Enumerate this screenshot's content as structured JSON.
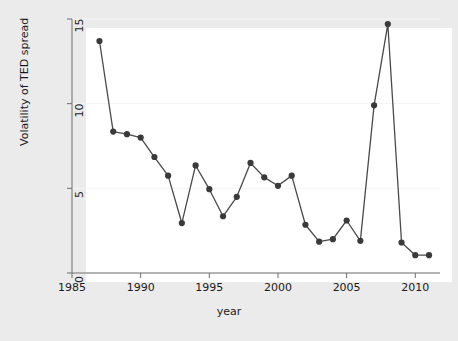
{
  "chart_data": {
    "type": "line",
    "title": "",
    "xlabel": "year",
    "ylabel": "Volatility of TED spread",
    "xlim": [
      1985,
      2011.8
    ],
    "ylim": [
      0,
      15
    ],
    "xticks": [
      1985,
      1990,
      1995,
      2000,
      2005,
      2010
    ],
    "yticks": [
      0,
      5,
      10,
      15
    ],
    "grid": true,
    "legend": null,
    "marker": "filled-circle",
    "line_color": "#4a4a4a",
    "marker_color": "#3a3a3a",
    "x": [
      1987,
      1988,
      1989,
      1990,
      1991,
      1992,
      1993,
      1994,
      1995,
      1996,
      1997,
      1998,
      1999,
      2000,
      2001,
      2002,
      2003,
      2004,
      2005,
      2006,
      2007,
      2008,
      2009,
      2010,
      2011
    ],
    "values": [
      13.7,
      8.35,
      8.2,
      8.0,
      6.85,
      5.75,
      2.95,
      6.35,
      4.95,
      3.35,
      4.5,
      6.5,
      5.65,
      5.15,
      5.75,
      2.85,
      1.85,
      2.0,
      3.1,
      1.9,
      9.9,
      14.7,
      1.8,
      1.05,
      1.05
    ],
    "series_name": "Volatility of TED spread"
  },
  "axes": {
    "x_tick_labels": [
      "1985",
      "1990",
      "1995",
      "2000",
      "2005",
      "2010"
    ],
    "y_tick_labels": [
      "0",
      "5",
      "10",
      "15"
    ],
    "x_axis_title": "year",
    "y_axis_title": "Volatility of TED spread"
  },
  "colors": {
    "figure_background": "#ebebeb",
    "plot_background": "#ffffff",
    "axis": "#6e6e6e",
    "gridline": "#f4f4f4",
    "text": "#1a1a1a",
    "line": "#4a4a4a",
    "marker": "#3a3a3a"
  }
}
